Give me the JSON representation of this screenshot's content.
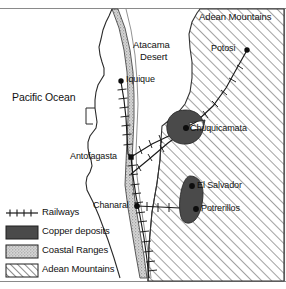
{
  "map": {
    "title": "Copper deposits and railways of northern Chile",
    "ocean_label": "Pacific Ocean",
    "regions": [
      {
        "id": "atacama",
        "label_line1": "Atacama",
        "label_line2": "Desert"
      },
      {
        "id": "andes",
        "label": "Adean Mountains"
      }
    ],
    "places": [
      {
        "id": "potosi",
        "label": "Potosi"
      },
      {
        "id": "iquique",
        "label": "Iquique"
      },
      {
        "id": "chuquicamata",
        "label": "Chuquicamata"
      },
      {
        "id": "antofagasta",
        "label": "Antofagasta"
      },
      {
        "id": "el-salvador",
        "label": "El Salvador"
      },
      {
        "id": "chanaral",
        "label": "Chanaral"
      },
      {
        "id": "potrerillos",
        "label": "Potrerillos"
      }
    ]
  },
  "legend": {
    "items": [
      {
        "id": "railways",
        "label": "Railways",
        "swatch": "railway-line"
      },
      {
        "id": "copper-deposits",
        "label": "Copper deposits",
        "swatch": "solid-dark"
      },
      {
        "id": "coastal-ranges",
        "label": "Coastal Ranges",
        "swatch": "stipple-gray"
      },
      {
        "id": "adean-mountains",
        "label": "Adean Mountains",
        "swatch": "diagonal-hatch"
      }
    ]
  },
  "colors": {
    "ink": "#111111",
    "paper": "#ffffff",
    "copper_fill": "#4a4a4a",
    "coastal_fill": "#c9c9c9",
    "hatch_stroke": "#555555",
    "border": "#8a8a8a"
  }
}
